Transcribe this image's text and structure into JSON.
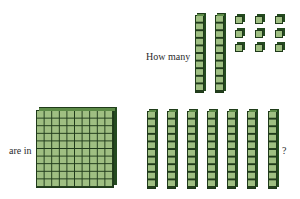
{
  "question": {
    "text_before": "How many",
    "text_middle": "are in",
    "text_end": "?"
  },
  "colors": {
    "cube_face": "#9fbf82",
    "cube_edge": "#1f3a1a",
    "cube_side": "#244a20",
    "background": "#ffffff"
  },
  "top_group": {
    "label": "How many",
    "rods": 2,
    "units": 9,
    "value": 29
  },
  "bottom_group": {
    "label": "are in",
    "flats": 1,
    "rods": 7,
    "units": 0,
    "value": 170
  }
}
